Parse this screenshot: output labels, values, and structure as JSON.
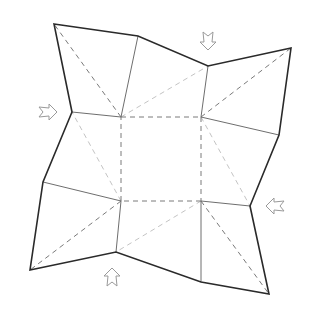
{
  "diagram": {
    "title": "",
    "colors": {
      "background": "#ffffff",
      "outline": "#2a2a2a",
      "crease_solid": "#6e6e6e",
      "valley_dashed": "#7a7a7a",
      "light_dashed": "#c4c4c4",
      "arrow_stroke": "#9a9a9a"
    },
    "outline_points": [
      [
        54,
        24
      ],
      [
        138,
        36
      ],
      [
        208,
        66
      ],
      [
        291,
        48
      ],
      [
        279,
        135
      ],
      [
        250,
        206
      ],
      [
        269,
        294
      ],
      [
        201,
        282
      ],
      [
        116,
        252
      ],
      [
        30,
        270
      ],
      [
        43,
        182
      ],
      [
        72,
        112
      ]
    ],
    "center_square": [
      [
        121,
        117
      ],
      [
        201,
        117
      ],
      [
        201,
        201
      ],
      [
        121,
        201
      ]
    ],
    "solid_creases": [
      [
        [
          121,
          117
        ],
        [
          138,
          36
        ]
      ],
      [
        [
          121,
          117
        ],
        [
          72,
          112
        ]
      ],
      [
        [
          201,
          117
        ],
        [
          208,
          66
        ]
      ],
      [
        [
          201,
          117
        ],
        [
          279,
          135
        ]
      ],
      [
        [
          201,
          201
        ],
        [
          250,
          206
        ]
      ],
      [
        [
          201,
          201
        ],
        [
          201,
          282
        ]
      ],
      [
        [
          121,
          201
        ],
        [
          116,
          252
        ]
      ],
      [
        [
          121,
          201
        ],
        [
          43,
          182
        ]
      ]
    ],
    "dashed_creases": [
      [
        [
          121,
          117
        ],
        [
          54,
          24
        ]
      ],
      [
        [
          201,
          117
        ],
        [
          291,
          48
        ]
      ],
      [
        [
          201,
          201
        ],
        [
          269,
          294
        ]
      ],
      [
        [
          121,
          201
        ],
        [
          30,
          270
        ]
      ]
    ],
    "light_dashed_creases": [
      [
        [
          121,
          117
        ],
        [
          208,
          66
        ]
      ],
      [
        [
          201,
          117
        ],
        [
          250,
          206
        ]
      ],
      [
        [
          201,
          201
        ],
        [
          116,
          252
        ]
      ],
      [
        [
          121,
          201
        ],
        [
          72,
          112
        ]
      ]
    ],
    "arrows": [
      {
        "name": "push-arrow-top",
        "x": 208,
        "y": 50,
        "direction": "down"
      },
      {
        "name": "push-arrow-left",
        "x": 57,
        "y": 112,
        "direction": "right"
      },
      {
        "name": "push-arrow-right",
        "x": 266,
        "y": 206,
        "direction": "left"
      },
      {
        "name": "push-arrow-bottom",
        "x": 112,
        "y": 268,
        "direction": "up"
      }
    ]
  }
}
